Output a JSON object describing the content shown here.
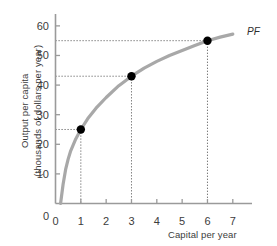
{
  "chart_data": {
    "type": "line",
    "title": "",
    "subtitle": "",
    "xlabel": "Capital per year",
    "ylabel_line1": "Output per capita",
    "ylabel_line2": "(thousands of dollars per year)",
    "xlim": [
      0,
      7.6
    ],
    "ylim": [
      0,
      63
    ],
    "xticks": [
      0,
      1,
      2,
      3,
      4,
      5,
      6,
      7
    ],
    "xtick_labels": [
      "0",
      "1",
      "2",
      "3",
      "4",
      "5",
      "6",
      "7"
    ],
    "yticks": [
      0,
      10,
      20,
      30,
      40,
      50,
      60
    ],
    "ytick_labels": [
      "0",
      "10",
      "20",
      "30",
      "40",
      "50",
      "60"
    ],
    "grid": false,
    "legend_position": "none",
    "series": [
      {
        "name": "PF",
        "label": "PF",
        "color": "#a8a8a8",
        "x": [
          0.2,
          0.3,
          0.4,
          0.5,
          0.6,
          0.8,
          1.0,
          1.3,
          1.6,
          2.0,
          2.5,
          3.0,
          3.5,
          4.0,
          4.5,
          5.0,
          5.5,
          6.0,
          6.5,
          7.0
        ],
        "y": [
          0.0,
          6.5,
          11.5,
          15.0,
          17.8,
          21.8,
          25.0,
          29.0,
          32.2,
          35.8,
          39.8,
          43.0,
          45.7,
          48.0,
          50.0,
          51.7,
          53.4,
          55.0,
          56.2,
          57.2
        ]
      }
    ],
    "markers": [
      {
        "x": 1,
        "y": 25,
        "color": "#000000",
        "dashed_guides": true
      },
      {
        "x": 3,
        "y": 43,
        "color": "#000000",
        "dashed_guides": true
      },
      {
        "x": 6,
        "y": 55,
        "color": "#000000",
        "dashed_guides": true
      }
    ],
    "annotations": [
      {
        "text": "PF",
        "x": 7.2,
        "y": 58,
        "style": "italic"
      }
    ],
    "colors": {
      "curve": "#a8a8a8",
      "axis": "#9a9a9a",
      "marker": "#000000",
      "guide_line": "#555555",
      "text": "#3c3c3c",
      "background": "#ffffff"
    }
  }
}
